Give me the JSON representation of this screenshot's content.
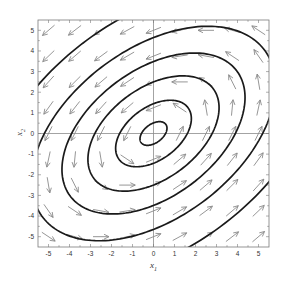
{
  "chart_data": {
    "type": "line",
    "subtype": "phase-portrait",
    "title": "",
    "xlabel": "x1",
    "ylabel": "x2",
    "xlim": [
      -5.5,
      5.5
    ],
    "ylim": [
      -5.5,
      5.5
    ],
    "xticks": [
      -5,
      -4,
      -3,
      -2,
      -1,
      0,
      1,
      2,
      3,
      4,
      5
    ],
    "yticks": [
      -5,
      -4,
      -3,
      -2,
      -1,
      0,
      1,
      2,
      3,
      4,
      5
    ],
    "xtick_labels": [
      "-5",
      "-4",
      "-3",
      "-2",
      "-1",
      "0",
      "1",
      "2",
      "3",
      "4",
      "5"
    ],
    "ytick_labels": [
      "-5",
      "-4",
      "-3",
      "-2",
      "-1",
      "0",
      "1",
      "2",
      "3",
      "4",
      "5"
    ],
    "grid": false,
    "zero_axes_lines": true,
    "legend": null,
    "level_set_function": "V(x1,x2) = x1^2 - x1*x2 + 1.25*x2^2",
    "contour_levels": [
      0.33,
      2.6,
      7.8,
      15.2,
      27,
      50
    ],
    "vector_field": {
      "equation_x1": "dx1/dt = x1 - 2.5*x2",
      "equation_x2": "dx2/dt = 2*x1 - x2",
      "grid_x": [
        -5,
        -3.75,
        -2.5,
        -1.25,
        0,
        1.25,
        2.5,
        3.75,
        5
      ],
      "grid_y": [
        -5,
        -3.75,
        -2.5,
        -1.25,
        0,
        1.25,
        2.5,
        3.75,
        5
      ],
      "direction": "counterclockwise",
      "normalized": true
    },
    "colors": {
      "contour": "#1a1a1a",
      "arrows": "#8a8a8a",
      "axes": "#7a7a7a",
      "zero_lines": "#8c8c8c"
    }
  },
  "labels": {
    "x_axis_main": "x",
    "x_axis_sub": "1",
    "y_axis_main": "x",
    "y_axis_sub": "2"
  }
}
